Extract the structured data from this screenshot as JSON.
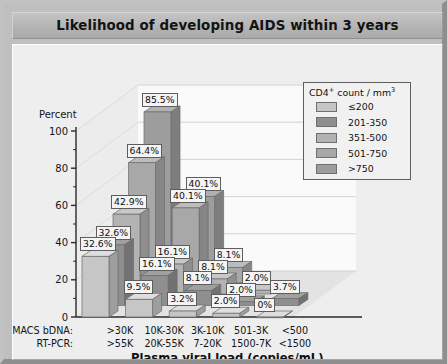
{
  "header": {
    "title": "Likelihood of developing AIDS within 3 years"
  },
  "axes": {
    "ylabel": "Percent",
    "yticks": [
      "0",
      "20",
      "40",
      "60",
      "80",
      "100"
    ],
    "xtitle": "Plasma viral load (copies/mL)",
    "row_label_macs": "MACS bDNA:",
    "row_label_rtpcr": "RT-PCR:"
  },
  "legend": {
    "title_main": "CD4",
    "title_sup": "+",
    "title_rest": " count / mm",
    "title_sup2": "3",
    "items": [
      {
        "label": "≤200",
        "color": "#c6c6c6"
      },
      {
        "label": "201-350",
        "color": "#8f8f8f"
      },
      {
        "label": "351-500",
        "color": "#b3b3b3"
      },
      {
        "label": "501-750",
        "color": "#a8a8a8"
      },
      {
        "label": ">750",
        "color": "#9d9d9d"
      }
    ]
  },
  "chart_data": {
    "type": "bar",
    "title": "Likelihood of developing AIDS within 3 years",
    "xlabel": "Plasma viral load (copies/mL)",
    "ylabel": "Percent",
    "ylim": [
      0,
      100
    ],
    "yticks": [
      0,
      20,
      40,
      60,
      80,
      100
    ],
    "grid": true,
    "legend_position": "top-right",
    "legend_title": "CD4+ count / mm3",
    "categories": [
      ">30K",
      "10K-30K",
      "3K-10K",
      "501-3K",
      "<500"
    ],
    "categories_rtpcr": [
      ">55K",
      "20K-55K",
      "7-20K",
      "1500-7K",
      "<1500"
    ],
    "series": [
      {
        "name": "≤200",
        "values": [
          32.6,
          9.5,
          3.2,
          2.0,
          0.0
        ]
      },
      {
        "name": "201-350",
        "values": [
          32.6,
          16.1,
          8.1,
          2.0,
          3.7
        ]
      },
      {
        "name": "351-500",
        "values": [
          42.9,
          16.1,
          8.1,
          2.0,
          null
        ]
      },
      {
        "name": "501-750",
        "values": [
          64.4,
          40.1,
          8.1,
          null,
          null
        ]
      },
      {
        "name": ">750",
        "values": [
          85.5,
          40.1,
          null,
          null,
          null
        ]
      }
    ],
    "data_labels": [
      {
        "group": ">30K",
        "series": "≤200",
        "text": "32.6%"
      },
      {
        "group": ">30K",
        "series": "201-350",
        "text": "32.6%"
      },
      {
        "group": ">30K",
        "series": "351-500",
        "text": "42.9%"
      },
      {
        "group": ">30K",
        "series": "501-750",
        "text": "64.4%"
      },
      {
        "group": ">30K",
        "series": ">750",
        "text": "85.5%"
      },
      {
        "group": "10K-30K",
        "series": "≤200",
        "text": "9.5%"
      },
      {
        "group": "10K-30K",
        "series": "201-350",
        "text": "16.1%"
      },
      {
        "group": "10K-30K",
        "series": "351-500",
        "text": "16.1%"
      },
      {
        "group": "10K-30K",
        "series": "501-750",
        "text": "40.1%"
      },
      {
        "group": "10K-30K",
        "series": ">750",
        "text": "40.1%"
      },
      {
        "group": "3K-10K",
        "series": "≤200",
        "text": "3.2%"
      },
      {
        "group": "3K-10K",
        "series": "201-350",
        "text": "8.1%"
      },
      {
        "group": "3K-10K",
        "series": "351-500",
        "text": "8.1%"
      },
      {
        "group": "3K-10K",
        "series": "501-750",
        "text": "8.1%"
      },
      {
        "group": "501-3K",
        "series": "≤200",
        "text": "2.0%"
      },
      {
        "group": "501-3K",
        "series": "201-350",
        "text": "2.0%"
      },
      {
        "group": "501-3K",
        "series": "351-500",
        "text": "2.0%"
      },
      {
        "group": "<500",
        "series": "≤200",
        "text": "0%"
      },
      {
        "group": "<500",
        "series": "201-350",
        "text": "3.7%"
      }
    ]
  }
}
